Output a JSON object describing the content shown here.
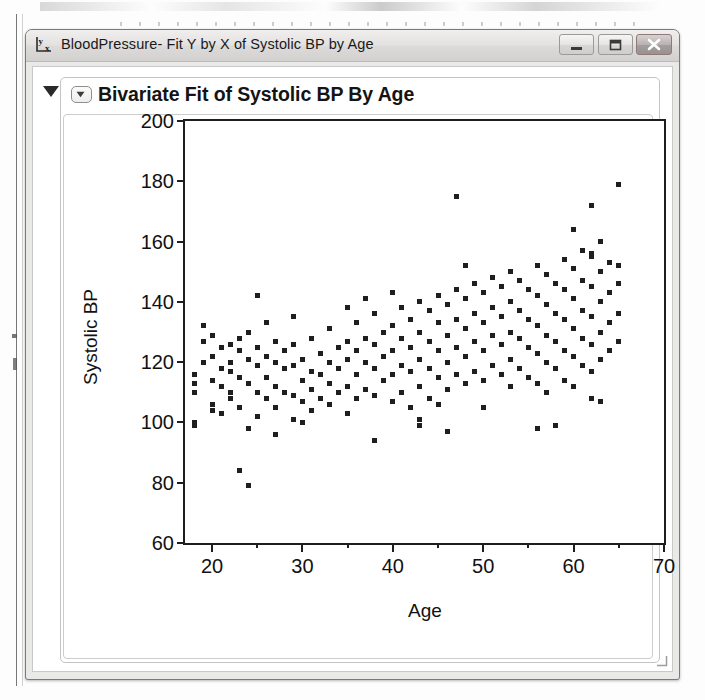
{
  "window": {
    "title": "BloodPressure- Fit Y by X of Systolic BP by Age",
    "icon_name": "y-by-x-icon",
    "buttons": {
      "minimize": "minimize-button",
      "maximize": "maximize-button",
      "close": "close-button"
    }
  },
  "report": {
    "title": "Bivariate Fit of Systolic BP By Age",
    "outline_triangle": "outline-disclosure-triangle",
    "header_disclosure": "header-disclosure-icon"
  },
  "colors": {
    "marker": "#1f1f1f",
    "axis": "#1e1e1e",
    "window_chrome": "#e3e2e0",
    "panel_background": "#ffffff",
    "close_button": "#a49e9d"
  },
  "chart_data": {
    "type": "scatter",
    "title": "Bivariate Fit of Systolic BP By Age",
    "xlabel": "Age",
    "ylabel": "Systolic BP",
    "xlim": [
      17,
      70
    ],
    "ylim": [
      60,
      200
    ],
    "xticks": [
      20,
      30,
      40,
      50,
      60,
      70
    ],
    "xminor_ticks": [
      25,
      35,
      45,
      55,
      65
    ],
    "yticks": [
      60,
      80,
      100,
      120,
      140,
      160,
      180,
      200
    ],
    "grid": false,
    "legend": null,
    "marker": "square",
    "points": [
      [
        18,
        113
      ],
      [
        18,
        110
      ],
      [
        18,
        100
      ],
      [
        18,
        99
      ],
      [
        18,
        116
      ],
      [
        19,
        120
      ],
      [
        19,
        127
      ],
      [
        19,
        132
      ],
      [
        20,
        122
      ],
      [
        20,
        114
      ],
      [
        20,
        106
      ],
      [
        20,
        104
      ],
      [
        20,
        129
      ],
      [
        21,
        118
      ],
      [
        21,
        125
      ],
      [
        21,
        112
      ],
      [
        21,
        103
      ],
      [
        22,
        126
      ],
      [
        22,
        120
      ],
      [
        22,
        110
      ],
      [
        22,
        108
      ],
      [
        22,
        117
      ],
      [
        23,
        124
      ],
      [
        23,
        115
      ],
      [
        23,
        128
      ],
      [
        23,
        105
      ],
      [
        23,
        84
      ],
      [
        24,
        130
      ],
      [
        24,
        121
      ],
      [
        24,
        113
      ],
      [
        24,
        98
      ],
      [
        24,
        79
      ],
      [
        25,
        142
      ],
      [
        25,
        125
      ],
      [
        25,
        119
      ],
      [
        25,
        110
      ],
      [
        25,
        102
      ],
      [
        26,
        133
      ],
      [
        26,
        122
      ],
      [
        26,
        115
      ],
      [
        26,
        108
      ],
      [
        27,
        127
      ],
      [
        27,
        120
      ],
      [
        27,
        112
      ],
      [
        27,
        105
      ],
      [
        27,
        96
      ],
      [
        28,
        124
      ],
      [
        28,
        118
      ],
      [
        28,
        110
      ],
      [
        29,
        135
      ],
      [
        29,
        126
      ],
      [
        29,
        119
      ],
      [
        29,
        109
      ],
      [
        29,
        101
      ],
      [
        30,
        121
      ],
      [
        30,
        114
      ],
      [
        30,
        107
      ],
      [
        30,
        100
      ],
      [
        31,
        128
      ],
      [
        31,
        117
      ],
      [
        31,
        111
      ],
      [
        31,
        104
      ],
      [
        32,
        123
      ],
      [
        32,
        116
      ],
      [
        32,
        108
      ],
      [
        33,
        131
      ],
      [
        33,
        120
      ],
      [
        33,
        113
      ],
      [
        33,
        106
      ],
      [
        34,
        125
      ],
      [
        34,
        118
      ],
      [
        34,
        110
      ],
      [
        35,
        138
      ],
      [
        35,
        127
      ],
      [
        35,
        121
      ],
      [
        35,
        112
      ],
      [
        35,
        103
      ],
      [
        36,
        133
      ],
      [
        36,
        124
      ],
      [
        36,
        116
      ],
      [
        36,
        108
      ],
      [
        37,
        141
      ],
      [
        37,
        128
      ],
      [
        37,
        120
      ],
      [
        37,
        111
      ],
      [
        38,
        136
      ],
      [
        38,
        126
      ],
      [
        38,
        118
      ],
      [
        38,
        109
      ],
      [
        38,
        94
      ],
      [
        39,
        130
      ],
      [
        39,
        122
      ],
      [
        39,
        114
      ],
      [
        40,
        143
      ],
      [
        40,
        132
      ],
      [
        40,
        124
      ],
      [
        40,
        116
      ],
      [
        40,
        107
      ],
      [
        41,
        138
      ],
      [
        41,
        128
      ],
      [
        41,
        119
      ],
      [
        41,
        110
      ],
      [
        42,
        134
      ],
      [
        42,
        125
      ],
      [
        42,
        117
      ],
      [
        42,
        105
      ],
      [
        43,
        140
      ],
      [
        43,
        130
      ],
      [
        43,
        121
      ],
      [
        43,
        112
      ],
      [
        43,
        101
      ],
      [
        43,
        99
      ],
      [
        44,
        137
      ],
      [
        44,
        127
      ],
      [
        44,
        118
      ],
      [
        44,
        108
      ],
      [
        45,
        142
      ],
      [
        45,
        133
      ],
      [
        45,
        124
      ],
      [
        45,
        115
      ],
      [
        45,
        106
      ],
      [
        46,
        139
      ],
      [
        46,
        129
      ],
      [
        46,
        120
      ],
      [
        46,
        111
      ],
      [
        46,
        97
      ],
      [
        47,
        175
      ],
      [
        47,
        144
      ],
      [
        47,
        134
      ],
      [
        47,
        125
      ],
      [
        47,
        116
      ],
      [
        48,
        152
      ],
      [
        48,
        141
      ],
      [
        48,
        131
      ],
      [
        48,
        122
      ],
      [
        48,
        113
      ],
      [
        49,
        146
      ],
      [
        49,
        136
      ],
      [
        49,
        127
      ],
      [
        49,
        117
      ],
      [
        50,
        143
      ],
      [
        50,
        133
      ],
      [
        50,
        124
      ],
      [
        50,
        114
      ],
      [
        50,
        105
      ],
      [
        51,
        148
      ],
      [
        51,
        138
      ],
      [
        51,
        129
      ],
      [
        51,
        119
      ],
      [
        52,
        145
      ],
      [
        52,
        135
      ],
      [
        52,
        126
      ],
      [
        52,
        116
      ],
      [
        53,
        150
      ],
      [
        53,
        140
      ],
      [
        53,
        130
      ],
      [
        53,
        121
      ],
      [
        53,
        112
      ],
      [
        54,
        147
      ],
      [
        54,
        137
      ],
      [
        54,
        128
      ],
      [
        54,
        118
      ],
      [
        55,
        144
      ],
      [
        55,
        134
      ],
      [
        55,
        125
      ],
      [
        55,
        115
      ],
      [
        56,
        152
      ],
      [
        56,
        142
      ],
      [
        56,
        132
      ],
      [
        56,
        123
      ],
      [
        56,
        113
      ],
      [
        56,
        98
      ],
      [
        57,
        149
      ],
      [
        57,
        139
      ],
      [
        57,
        129
      ],
      [
        57,
        120
      ],
      [
        57,
        110
      ],
      [
        58,
        146
      ],
      [
        58,
        136
      ],
      [
        58,
        127
      ],
      [
        58,
        118
      ],
      [
        58,
        99
      ],
      [
        59,
        154
      ],
      [
        59,
        144
      ],
      [
        59,
        134
      ],
      [
        59,
        124
      ],
      [
        59,
        114
      ],
      [
        60,
        164
      ],
      [
        60,
        151
      ],
      [
        60,
        141
      ],
      [
        60,
        131
      ],
      [
        60,
        122
      ],
      [
        60,
        112
      ],
      [
        61,
        157
      ],
      [
        61,
        147
      ],
      [
        61,
        137
      ],
      [
        61,
        128
      ],
      [
        61,
        119
      ],
      [
        62,
        172
      ],
      [
        62,
        156
      ],
      [
        62,
        155
      ],
      [
        62,
        145
      ],
      [
        62,
        135
      ],
      [
        62,
        126
      ],
      [
        62,
        117
      ],
      [
        62,
        108
      ],
      [
        63,
        160
      ],
      [
        63,
        150
      ],
      [
        63,
        140
      ],
      [
        63,
        130
      ],
      [
        63,
        121
      ],
      [
        63,
        107
      ],
      [
        64,
        153
      ],
      [
        64,
        143
      ],
      [
        64,
        133
      ],
      [
        64,
        124
      ],
      [
        65,
        179
      ],
      [
        65,
        152
      ],
      [
        65,
        146
      ],
      [
        65,
        136
      ],
      [
        65,
        127
      ]
    ]
  }
}
